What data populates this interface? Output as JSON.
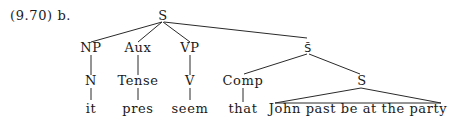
{
  "example_label": "(9.70) b.",
  "nodes": {
    "root": {
      "label": "S",
      "x": 163,
      "y": 20
    },
    "np": {
      "label": "NP",
      "x": 91,
      "y": 52
    },
    "aux": {
      "label": "Aux",
      "x": 138,
      "y": 52
    },
    "vp": {
      "label": "VP",
      "x": 190,
      "y": 52
    },
    "sbar": {
      "label": "S̄",
      "x": 308,
      "y": 52
    },
    "n": {
      "label": "N",
      "x": 91,
      "y": 85
    },
    "tense": {
      "label": "Tense",
      "x": 138,
      "y": 85
    },
    "v": {
      "label": "V",
      "x": 190,
      "y": 85
    },
    "comp": {
      "label": "Comp",
      "x": 243,
      "y": 85
    },
    "s_inner": {
      "label": "S",
      "x": 362,
      "y": 85
    }
  },
  "leaves": {
    "it": {
      "label": "it",
      "x": 91,
      "y": 111
    },
    "pres": {
      "label": "pres",
      "x": 138,
      "y": 111
    },
    "seem": {
      "label": "seem",
      "x": 190,
      "y": 111
    },
    "that": {
      "label": "that",
      "x": 243,
      "y": 111
    },
    "clause": {
      "label": "John past be at the party",
      "x": 362,
      "y": 111
    }
  }
}
